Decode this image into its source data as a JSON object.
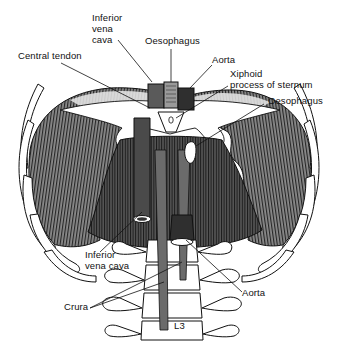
{
  "diagram": {
    "labels": {
      "ivc_top_1": "Inferior",
      "ivc_top_2": "vena",
      "ivc_top_3": "cava",
      "oesophagus_top": "Oesophagus",
      "central_tendon": "Central tendon",
      "aorta_top": "Aorta",
      "xiphoid_1": "Xiphoid",
      "xiphoid_2": "process of sternum",
      "oesophagus_right": "Oesophagus",
      "ivc_bottom_1": "Inferior",
      "ivc_bottom_2": "vena cava",
      "crura": "Crura",
      "aorta_bottom": "Aorta",
      "vertebra": "L3"
    },
    "colors": {
      "ink": "#111111",
      "muscle_dark": "#3a3a3a",
      "muscle_mid": "#6b6b6b",
      "vessel": "#4a4a4a",
      "bone": "#ffffff",
      "background": "#ffffff"
    }
  }
}
